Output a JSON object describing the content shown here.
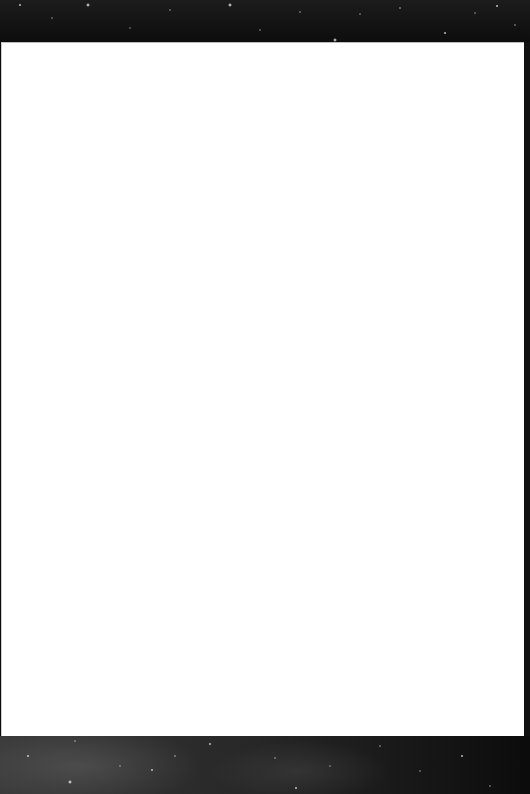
{
  "background": {
    "top_band": {
      "type": "starfield",
      "height_px": 42
    },
    "bottom_band": {
      "type": "starfield",
      "height_px": 58
    }
  },
  "page": {
    "content": "",
    "color": "#ffffff"
  },
  "colors": {
    "page": "#ffffff",
    "starfield_dark": "#0d0d0d",
    "edge_strip": "#111111"
  }
}
